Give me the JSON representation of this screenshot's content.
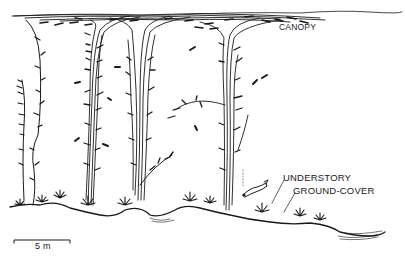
{
  "figure": {
    "type": "kelp-forest-cross-section-illustration",
    "style": "black-and-white line drawing",
    "background_color": "#ffffff",
    "ink_color": "#1a1a1a"
  },
  "labels": {
    "canopy": "CANOPY",
    "understory": "UNDERSTORY",
    "ground_cover": "GROUND-COVER"
  },
  "scale_bar": {
    "label": "5 m"
  },
  "elements": {
    "kelp_stalks": 5,
    "fish_count": 9,
    "diver_count": 1
  }
}
